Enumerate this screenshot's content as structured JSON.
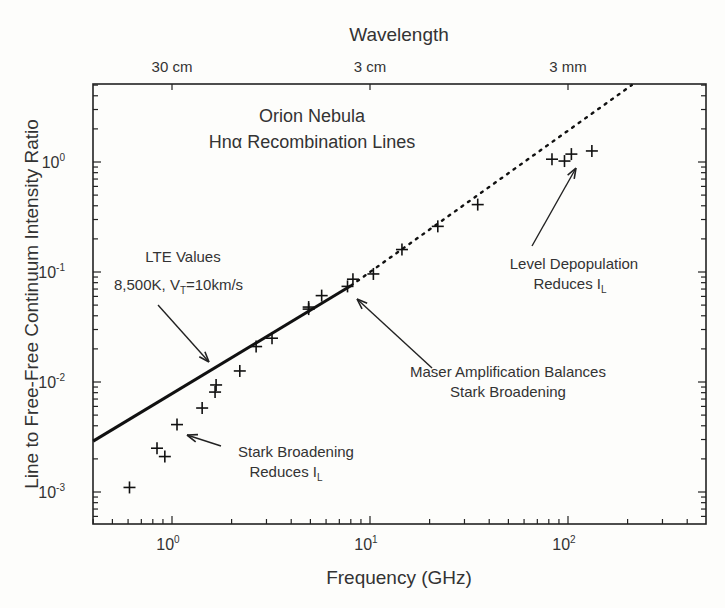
{
  "chart_data": {
    "type": "scatter",
    "title": "Orion Nebula Hnα Recombination Lines",
    "annotation_title": [
      "Orion Nebula",
      "Hnα Recombination Lines"
    ],
    "xlabel": "Frequency (GHz)",
    "ylabel": "Line to Free-Free Continuum Intensity Ratio",
    "top_axis_label": "Wavelength",
    "xscale": "log",
    "yscale": "log",
    "xlim": [
      0.4,
      500
    ],
    "ylim": [
      0.0005,
      5
    ],
    "x_ticks": [
      {
        "value": 1,
        "label": "10",
        "exp": "0"
      },
      {
        "value": 10,
        "label": "10",
        "exp": "1"
      },
      {
        "value": 100,
        "label": "10",
        "exp": "2"
      }
    ],
    "y_ticks": [
      {
        "value": 1,
        "label": "10",
        "exp": "0"
      },
      {
        "value": 0.1,
        "label": "10",
        "exp": "-1"
      },
      {
        "value": 0.01,
        "label": "10",
        "exp": "-2"
      },
      {
        "value": 0.001,
        "label": "10",
        "exp": "-3"
      }
    ],
    "top_ticks": [
      {
        "value": 1,
        "label": "30 cm"
      },
      {
        "value": 10,
        "label": "3 cm"
      },
      {
        "value": 100,
        "label": "3 mm"
      }
    ],
    "grid": false,
    "legend": null,
    "series": [
      {
        "name": "Observed Hnα line ratios",
        "marker": "+",
        "points": [
          [
            0.61,
            0.0011
          ],
          [
            0.84,
            0.0025
          ],
          [
            0.92,
            0.0021
          ],
          [
            1.06,
            0.0041
          ],
          [
            1.42,
            0.0058
          ],
          [
            1.65,
            0.0081
          ],
          [
            1.67,
            0.0094
          ],
          [
            2.2,
            0.0126
          ],
          [
            2.66,
            0.021
          ],
          [
            3.2,
            0.025
          ],
          [
            4.9,
            0.046
          ],
          [
            4.9,
            0.048
          ],
          [
            5.7,
            0.061
          ],
          [
            7.7,
            0.074
          ],
          [
            8.2,
            0.086
          ],
          [
            10.4,
            0.096
          ],
          [
            14.5,
            0.16
          ],
          [
            22,
            0.26
          ],
          [
            35,
            0.41
          ],
          [
            83,
            1.06
          ],
          [
            96,
            1.02
          ],
          [
            104,
            1.18
          ],
          [
            132,
            1.26
          ]
        ]
      },
      {
        "name": "LTE Values 8,500K, VT=10km/s",
        "type": "line",
        "solid_range": [
          0.4,
          8
        ],
        "dotted_range": [
          8,
          210
        ],
        "points": [
          [
            0.4,
            0.0029
          ],
          [
            8,
            0.075
          ],
          [
            210,
            5.0
          ]
        ]
      }
    ],
    "annotations": [
      {
        "id": "lte",
        "lines": [
          "LTE Values",
          "8,500K, V",
          "T",
          "=10km/s"
        ]
      },
      {
        "id": "stark",
        "lines": [
          "Stark Broadening",
          "Reduces I",
          "L"
        ]
      },
      {
        "id": "maser",
        "lines": [
          "Maser Amplification Balances",
          "Stark Broadening"
        ]
      },
      {
        "id": "depop",
        "lines": [
          "Level Depopulation",
          "Reduces I",
          "L"
        ]
      }
    ]
  }
}
